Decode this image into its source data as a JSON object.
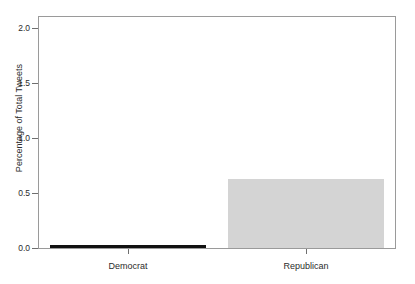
{
  "chart_data": {
    "type": "bar",
    "title": "",
    "subtitle": "",
    "xlabel": "",
    "ylabel": "Percentage of Total Tweets",
    "categories": [
      "Democrat",
      "Republican"
    ],
    "values": [
      0.02,
      0.63
    ],
    "series": [
      {
        "name": "Percentage of Total Tweets",
        "values": [
          0.02,
          0.63
        ]
      }
    ],
    "bar_colors": [
      "#111111",
      "#d4d4d4"
    ],
    "ylim": [
      0.0,
      2.1
    ],
    "yticks": [
      0.0,
      0.5,
      1.0,
      1.5,
      2.0
    ],
    "ytick_labels": [
      "0.0",
      "0.5",
      "1.0",
      "1.5",
      "2.0"
    ],
    "xtick_labels": [
      "Democrat",
      "Republican"
    ],
    "grid": false,
    "legend": false,
    "legend_position": "none",
    "annotations": [],
    "box_border": true,
    "axis_color": "#9a9a9a",
    "text_color": "#2b2b2b",
    "background": "#ffffff"
  }
}
